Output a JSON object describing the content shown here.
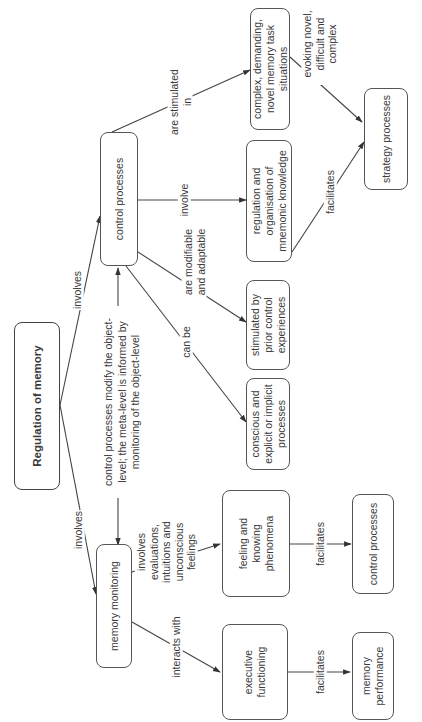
{
  "diagram": {
    "type": "concept-map",
    "orientation": "rotated-90-ccw",
    "nodes": {
      "root": "Regulation of memory",
      "control": "control processes",
      "monitoring": "memory monitoring",
      "complex": "complex, demanding, novel memory task situations",
      "regulation": "regulation and organisation of mnemonic knowledge",
      "stimulated": "stimulated by prior control experiences",
      "conscious": "conscious and explicit or implicit processes",
      "strategy": "strategy processes",
      "feeling": "feeling and knowing phenomena",
      "control2": "control processes",
      "executive": "executive functioning",
      "performance": "memory performance"
    },
    "links": {
      "root_control": "involves",
      "root_monitoring": "involves",
      "bidirectional": "control processes modify the object-level; the meta-level is informed by monitoring of the object-level",
      "control_complex": "are stimulated in",
      "control_regulation": "involve",
      "control_stimulated": "are modifiable and adaptable",
      "control_conscious": "can be",
      "complex_strategy": "evoking novel, difficult and complex",
      "regulation_strategy": "facilitates",
      "monitoring_feeling": "involves evaluations, intuitions and unconscious feelings",
      "monitoring_executive": "interacts with",
      "feeling_control2": "facilitates",
      "executive_performance": "facilitates"
    }
  }
}
